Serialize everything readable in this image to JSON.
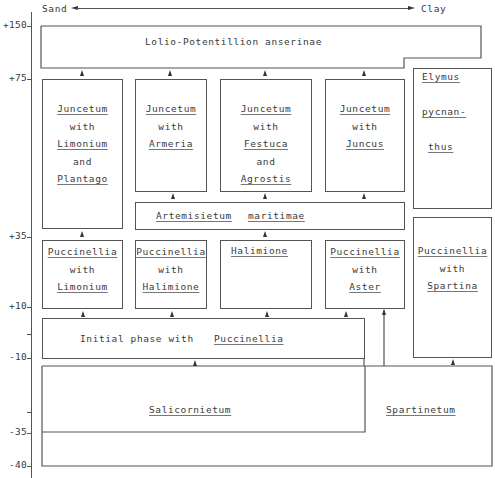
{
  "gradient": {
    "left_label": "Sand",
    "right_label": "Clay"
  },
  "axis": {
    "ticks": [
      {
        "label": "+150",
        "y": 26
      },
      {
        "label": "+75",
        "y": 79
      },
      {
        "label": "+35",
        "y": 237
      },
      {
        "label": "+10",
        "y": 307
      },
      {
        "label": "-10",
        "y": 358
      },
      {
        "label": "-35",
        "y": 433
      },
      {
        "label": "-40",
        "y": 466
      }
    ]
  },
  "boxes": {
    "lolio": {
      "name": "Lolio-Potentillion anserinae"
    },
    "juncetum_limonium": {
      "lines": [
        "Juncetum",
        "with",
        "Limonium",
        "and",
        "Plantago"
      ]
    },
    "juncetum_armeria": {
      "lines": [
        "Juncetum",
        "with",
        "Armeria"
      ]
    },
    "juncetum_festuca": {
      "lines": [
        "Juncetum",
        "with",
        "Festuca",
        "and",
        "Agrostis"
      ]
    },
    "juncetum_juncus": {
      "lines": [
        "Juncetum",
        "with",
        "Juncus"
      ]
    },
    "elymus": {
      "lines": [
        "Elymus",
        "pycnan-",
        "thus"
      ]
    },
    "artemisietum": {
      "word1": "Artemisietum",
      "word2": "maritimae"
    },
    "pucc_limonium": {
      "lines": [
        "Puccinellia",
        "with",
        "Limonium"
      ]
    },
    "pucc_halimione": {
      "lines": [
        "Puccinellia",
        "with",
        "Halimione"
      ]
    },
    "halimione": {
      "lines": [
        "Halimione"
      ]
    },
    "pucc_aster": {
      "lines": [
        "Puccinellia",
        "with",
        "Aster"
      ]
    },
    "pucc_spartina": {
      "lines": [
        "Puccinellia",
        "with",
        "Spartina"
      ]
    },
    "initial": {
      "prefix": "Initial  phase  with",
      "species": "Puccinellia"
    },
    "salicornietum": {
      "name": "Salicornietum"
    },
    "spartinetum": {
      "name": "Spartinetum"
    }
  }
}
